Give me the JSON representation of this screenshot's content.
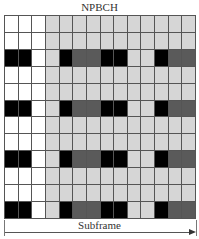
{
  "title": "NPBCH",
  "axis_label": "Subframe",
  "colors": {
    "W": "#ffffff",
    "L": "#d6d6d6",
    "D": "#5a5a5a",
    "B": "#000000",
    "grid_line": "#555555"
  },
  "legend_meaning": {
    "W": "white (unused / control region)",
    "L": "light gray (NPBCH resource element)",
    "D": "dark gray",
    "B": "black (reference signal)"
  },
  "grid": {
    "columns": 14,
    "rows": 12,
    "cells": [
      [
        "W",
        "W",
        "W",
        "L",
        "L",
        "L",
        "L",
        "L",
        "L",
        "L",
        "L",
        "L",
        "L",
        "L"
      ],
      [
        "W",
        "W",
        "W",
        "L",
        "L",
        "L",
        "L",
        "L",
        "L",
        "L",
        "L",
        "L",
        "L",
        "L"
      ],
      [
        "B",
        "B",
        "W",
        "L",
        "B",
        "D",
        "D",
        "B",
        "B",
        "L",
        "L",
        "B",
        "D",
        "D"
      ],
      [
        "W",
        "W",
        "W",
        "L",
        "L",
        "L",
        "L",
        "L",
        "L",
        "L",
        "L",
        "L",
        "L",
        "L"
      ],
      [
        "W",
        "W",
        "W",
        "L",
        "L",
        "L",
        "L",
        "L",
        "L",
        "L",
        "L",
        "L",
        "L",
        "L"
      ],
      [
        "B",
        "B",
        "W",
        "L",
        "B",
        "D",
        "D",
        "B",
        "B",
        "L",
        "L",
        "B",
        "D",
        "D"
      ],
      [
        "W",
        "W",
        "W",
        "L",
        "L",
        "L",
        "L",
        "L",
        "L",
        "L",
        "L",
        "L",
        "L",
        "L"
      ],
      [
        "W",
        "W",
        "W",
        "L",
        "L",
        "L",
        "L",
        "L",
        "L",
        "L",
        "L",
        "L",
        "L",
        "L"
      ],
      [
        "B",
        "B",
        "W",
        "L",
        "B",
        "D",
        "D",
        "B",
        "B",
        "L",
        "L",
        "B",
        "D",
        "D"
      ],
      [
        "W",
        "W",
        "W",
        "L",
        "L",
        "L",
        "L",
        "L",
        "L",
        "L",
        "L",
        "L",
        "L",
        "L"
      ],
      [
        "W",
        "W",
        "W",
        "L",
        "L",
        "L",
        "L",
        "L",
        "L",
        "L",
        "L",
        "L",
        "L",
        "L"
      ],
      [
        "B",
        "B",
        "W",
        "L",
        "B",
        "D",
        "D",
        "B",
        "B",
        "L",
        "L",
        "B",
        "D",
        "D"
      ]
    ]
  }
}
